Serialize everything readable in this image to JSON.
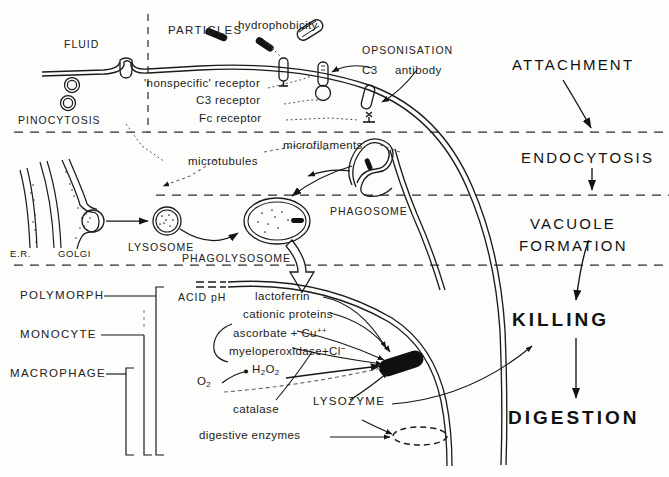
{
  "stages": [
    {
      "id": "attachment",
      "label": "ATTACHMENT"
    },
    {
      "id": "endocytosis",
      "label": "ENDOCYTOSIS"
    },
    {
      "id": "vacuole_formation_line1",
      "label": "VACUOLE"
    },
    {
      "id": "vacuole_formation_line2",
      "label": "FORMATION"
    },
    {
      "id": "killing",
      "label": "KILLING"
    },
    {
      "id": "digestion",
      "label": "DIGESTION"
    }
  ],
  "attachment_zone": {
    "fluid": "FLUID",
    "pinocytosis": "PINOCYTOSIS",
    "particles": "PARTICLES",
    "hydrophobicity": "hydrophobicity",
    "nonspecific_receptor": "'nonspecific' receptor",
    "c3_receptor": "C3 receptor",
    "fc_receptor": "Fc receptor",
    "opsonisation": "OPSONISATION",
    "c3": "C3",
    "antibody": "antibody"
  },
  "endocytosis_zone": {
    "microtubules": "microtubules",
    "microfilaments": "microfilaments"
  },
  "vacuole_zone": {
    "er": "E.R.",
    "golgi": "GOLGI",
    "lysosome": "LYSOSOME",
    "phagolysosome": "PHAGOLYSOSOME",
    "phagosome": "PHAGOSOME"
  },
  "cell_types": [
    {
      "label": "POLYMORPH"
    },
    {
      "label": "MONOCYTE"
    },
    {
      "label": "MACROPHAGE"
    }
  ],
  "killing_zone": {
    "acid_ph": "ACID pH",
    "lactoferrin": "lactoferrin",
    "cationic_proteins": "cationic proteins",
    "ascorbate": "ascorbate + Cu",
    "ascorbate_sup": "++",
    "myeloperoxidase": "myeloperoxidase+Cl",
    "myeloperoxidase_sup": "−",
    "oxygen": "O",
    "oxygen_sub": "2",
    "peroxide_h": "H",
    "peroxide_sub1": "2",
    "peroxide_o": "O",
    "peroxide_sub2": "2",
    "catalase": "catalase",
    "lysozyme": "LYSOZYME",
    "digestive_enzymes": "digestive  enzymes"
  },
  "colors": {
    "ink": "#141414",
    "line": "#1b1b1b",
    "dashed_divider": "#2a2a2a",
    "background": "#fdfdfb",
    "bacterium_fill": "#101010"
  }
}
